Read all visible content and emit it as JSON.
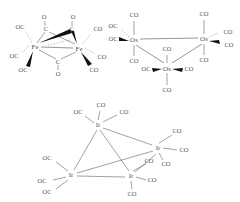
{
  "figure": {
    "background": "#ffffff",
    "line_color": "#8a8a8a",
    "label_color": "#555555",
    "wedge_color": "#000000",
    "width": 240,
    "height": 202
  },
  "structures": [
    {
      "id": "fe2co9",
      "name": "Fe2(CO)9",
      "geometry": "two-metal bridged dimer",
      "metals": [
        {
          "label": "Fe",
          "x": 35,
          "y": 46
        },
        {
          "label": "Fe",
          "x": 79,
          "y": 48
        }
      ],
      "bridging_carbonyls": [
        {
          "c_label": "C",
          "o_label": "O",
          "cx": 46,
          "cy": 28,
          "ox": 44,
          "oy": 16
        },
        {
          "c_label": "C",
          "o_label": "O",
          "cx": 71,
          "cy": 28,
          "ox": 73,
          "oy": 16
        },
        {
          "c_label": "C",
          "o_label": "O",
          "cx": 58,
          "cy": 62,
          "ox": 58,
          "oy": 74
        }
      ],
      "terminal_carbonyls": [
        {
          "label": "OC",
          "x": 20,
          "y": 27
        },
        {
          "label": "OC",
          "x": 14,
          "y": 56
        },
        {
          "label": "OC",
          "x": 23,
          "y": 70
        },
        {
          "label": "CO",
          "x": 98,
          "y": 29
        },
        {
          "label": "CO",
          "x": 103,
          "y": 58
        },
        {
          "label": "CO",
          "x": 94,
          "y": 70
        }
      ]
    },
    {
      "id": "os3co12",
      "name": "Os3(CO)12",
      "geometry": "triangular trimer",
      "metals": [
        {
          "label": "Os",
          "x": 134,
          "y": 40
        },
        {
          "label": "Os",
          "x": 204,
          "y": 39
        },
        {
          "label": "Os",
          "x": 167,
          "y": 68
        }
      ],
      "terminal_carbonyls": [
        {
          "label": "CO",
          "x": 134,
          "y": 15
        },
        {
          "label": "CO",
          "x": 134,
          "y": 61
        },
        {
          "label": "OC",
          "x": 112,
          "y": 26
        },
        {
          "label": "OC",
          "x": 112,
          "y": 38
        },
        {
          "label": "CO",
          "x": 204,
          "y": 14
        },
        {
          "label": "CO",
          "x": 204,
          "y": 60
        },
        {
          "label": "CO",
          "x": 228,
          "y": 32
        },
        {
          "label": "CO",
          "x": 229,
          "y": 45
        },
        {
          "label": "CO",
          "x": 167,
          "y": 49
        },
        {
          "label": "CO",
          "x": 167,
          "y": 90
        },
        {
          "label": "OC",
          "x": 146,
          "y": 70
        },
        {
          "label": "CO",
          "x": 189,
          "y": 70
        }
      ]
    },
    {
      "id": "ir4co12",
      "name": "Ir4(CO)12",
      "geometry": "tetrahedral tetramer",
      "metals": [
        {
          "label": "Ir",
          "x": 98,
          "y": 125
        },
        {
          "label": "Ir",
          "x": 158,
          "y": 148
        },
        {
          "label": "Ir",
          "x": 71,
          "y": 175
        },
        {
          "label": "Ir",
          "x": 131,
          "y": 176
        }
      ],
      "terminal_carbonyls": [
        {
          "label": "CO",
          "x": 101,
          "y": 105
        },
        {
          "label": "OC",
          "x": 78,
          "y": 112
        },
        {
          "label": "CO",
          "x": 124,
          "y": 112
        },
        {
          "label": "CO",
          "x": 177,
          "y": 131
        },
        {
          "label": "CO",
          "x": 184,
          "y": 150
        },
        {
          "label": "CO",
          "x": 166,
          "y": 164
        },
        {
          "label": "OC",
          "x": 47,
          "y": 158
        },
        {
          "label": "OC",
          "x": 42,
          "y": 181
        },
        {
          "label": "OC",
          "x": 47,
          "y": 192
        },
        {
          "label": "CO",
          "x": 149,
          "y": 161
        },
        {
          "label": "CO",
          "x": 152,
          "y": 180
        },
        {
          "label": "CO",
          "x": 132,
          "y": 194
        }
      ]
    }
  ]
}
